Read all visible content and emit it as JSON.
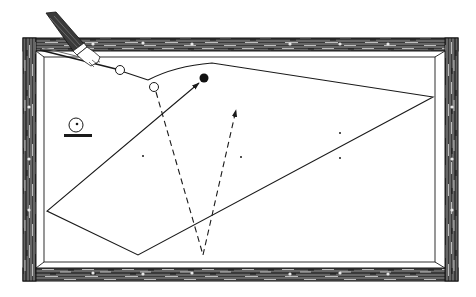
{
  "figure": {
    "title": "Billiard shot diagram"
  },
  "colors": {
    "background": "#ffffff",
    "ink": "#1a1a1a",
    "wood_dark": "#2b2b2b",
    "wood_light": "#9a9a9a",
    "cloth": "#ffffff",
    "sleeve": "#3a3a3a"
  },
  "table": {
    "outer_frame": {
      "x": 23,
      "y": 38,
      "w": 435,
      "h": 243
    },
    "inner_rail": {
      "x": 36,
      "y": 51,
      "w": 409,
      "h": 217
    },
    "cushion": {
      "x": 44,
      "y": 57,
      "w": 391,
      "h": 205
    }
  },
  "balls": [
    {
      "id": "cue-ball",
      "cx": 120,
      "cy": 70,
      "r": 4.5,
      "fill": "none"
    },
    {
      "id": "second-white-ball",
      "cx": 154,
      "cy": 87,
      "r": 4.5,
      "fill": "none"
    },
    {
      "id": "red-object-ball",
      "cx": 204,
      "cy": 78,
      "r": 4.5,
      "fill": "#111111"
    }
  ],
  "spots": [
    {
      "x": 143,
      "y": 156
    },
    {
      "x": 241,
      "y": 157
    },
    {
      "x": 340,
      "y": 133
    },
    {
      "x": 340,
      "y": 158
    }
  ],
  "solid_path": {
    "label": "Cue ball path",
    "points": [
      [
        120,
        70
      ],
      [
        148,
        80
      ],
      [
        170,
        70
      ],
      [
        212,
        63
      ],
      [
        433,
        97
      ],
      [
        138,
        255
      ],
      [
        47,
        211
      ],
      [
        199,
        83
      ]
    ],
    "arrow_end": [
      199,
      83
    ]
  },
  "dashed_paths": [
    {
      "label": "Object ball path down",
      "points": [
        [
          156,
          92
        ],
        [
          203,
          255
        ]
      ]
    },
    {
      "label": "Object ball path up (arrow)",
      "points": [
        [
          203,
          255
        ],
        [
          236,
          109
        ]
      ],
      "arrow_end": [
        236,
        109
      ]
    }
  ],
  "legend_symbol": {
    "label": "Ball on cushion symbol",
    "circle": {
      "cx": 76,
      "cy": 125,
      "r": 7
    },
    "dot": {
      "cx": 77,
      "cy": 124,
      "r": 1.3
    },
    "bar": {
      "x": 64,
      "y": 134,
      "w": 28,
      "h": 3
    }
  },
  "cue": {
    "label": "Cue stick held by hand",
    "tip": [
      118,
      70
    ],
    "butt": [
      52,
      42
    ]
  }
}
